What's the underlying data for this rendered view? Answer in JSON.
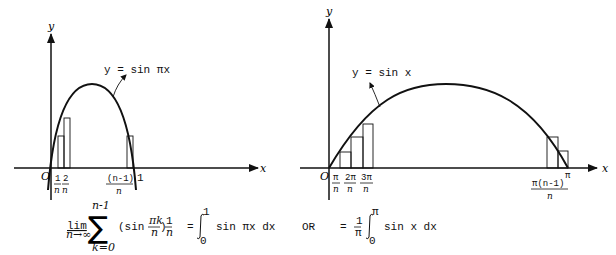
{
  "figure": {
    "left_graph": {
      "y_axis_label": "y",
      "x_axis_label": "x",
      "origin_label": "O",
      "curve_label": "y = sin πx",
      "ticks": [
        {
          "num": "1",
          "den": "n"
        },
        {
          "num": "2",
          "den": "n"
        },
        {
          "num": "(n-1)",
          "den": "n"
        }
      ],
      "end_label": "1"
    },
    "right_graph": {
      "y_axis_label": "y",
      "x_axis_label": "x",
      "origin_label": "O",
      "curve_label": "y = sin x",
      "ticks": [
        {
          "num": "π",
          "den": "n"
        },
        {
          "num": "2π",
          "den": "n"
        },
        {
          "num": "3π",
          "den": "n"
        },
        {
          "num": "π(n-1)",
          "den": "n"
        }
      ],
      "end_label": "π"
    },
    "formula": {
      "lim": "lim",
      "lim_sub": "n→∞",
      "sum_top": "n-1",
      "sum_bottom": "k=0",
      "sum_symbol": "∑",
      "term_open": "(sin",
      "term_frac_num": "πk",
      "term_frac_den": "n",
      "term_close": ")",
      "one_over_n_num": "1",
      "one_over_n_den": "n",
      "equals1": "=",
      "int1_upper": "1",
      "int1_lower": "0",
      "int1_body": "sin πx dx",
      "or": "OR",
      "equals2": "=",
      "coef_num": "1",
      "coef_den": "π",
      "int2_upper": "π",
      "int2_lower": "0",
      "int2_body": "sin x dx"
    }
  }
}
